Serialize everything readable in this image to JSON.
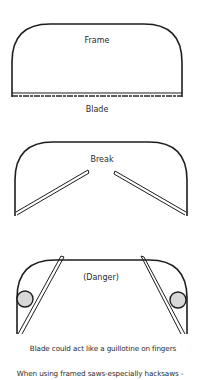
{
  "diagrams": [
    {
      "id": "intact",
      "labels": {
        "frame": "Frame",
        "blade": "Blade"
      }
    },
    {
      "id": "broken",
      "labels": {
        "break": "Break"
      }
    },
    {
      "id": "danger",
      "labels": {
        "danger": "(Danger)"
      }
    }
  ],
  "captions": {
    "warning": "Blade could act like a guillotine on fingers",
    "context": "When using framed saws-especially hacksaws -"
  },
  "colors": {
    "line": "#1e1e1e",
    "finger_fill": "#d8d8d8",
    "background": "#ffffff"
  }
}
